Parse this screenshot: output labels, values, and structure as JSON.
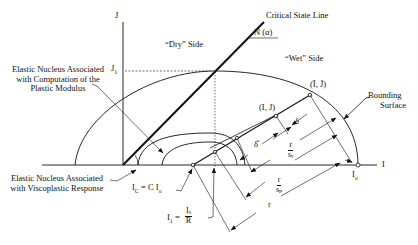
{
  "diagram": {
    "axes": {
      "vertical_label": "J",
      "horizontal_label": "I",
      "j1_tick_label": "J",
      "j1_tick_sub": "1"
    },
    "regions": {
      "dry_side": "“Dry” Side",
      "wet_side": "“Wet” Side"
    },
    "critical_state_line": {
      "label": "Critical State Line",
      "slope_label": "N (α)"
    },
    "bounding_surface": {
      "label_line1": "Bounding",
      "label_line2": "Surface"
    },
    "nucleus_plastic": {
      "line1": "Elastic Nucleus Associated",
      "line2": "with Computation of the",
      "line3": "Plastic Modulus"
    },
    "nucleus_viscoplastic": {
      "line1": "Elastic Nucleus Associated",
      "line2": "with Viscoplastic Response"
    },
    "points": {
      "current_state": "(I, J)",
      "image_point": "(Ī, J̄)",
      "i0": "I",
      "i0_sub": "o"
    },
    "equations": {
      "ic_eq": "I",
      "ic_sub": "C",
      "ic_rhs": " = C I",
      "ic_rhs_sub": "o",
      "i1_lhs": "I",
      "i1_sub": "1",
      "i1_eq": " = ",
      "i1_num": "Iₒ",
      "i1_den": "R"
    },
    "distances": {
      "delta": "δ",
      "delta_hat": "δ̂",
      "r_over_sv_num": "r",
      "r_over_sv_den": "sᵥ",
      "r_over_sp_num": "r",
      "r_over_sp_den": "sₚ",
      "r": "r"
    }
  }
}
